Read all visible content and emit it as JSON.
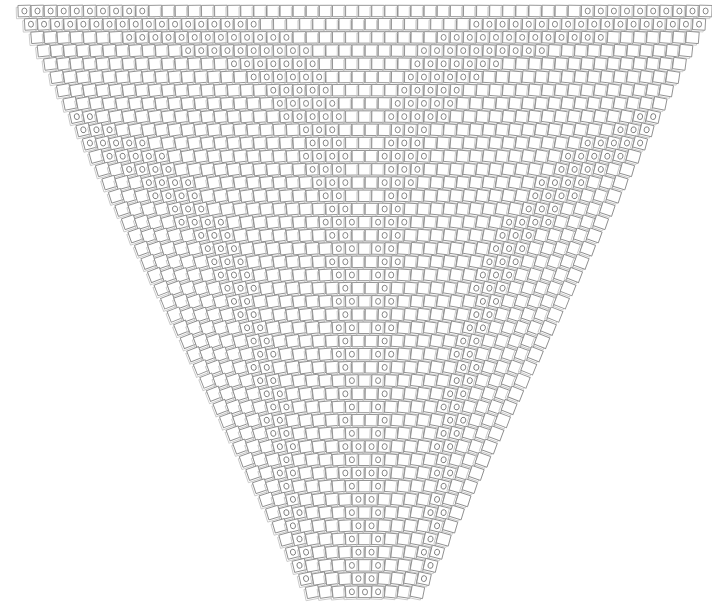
{
  "figure": {
    "title": "",
    "type": "generative-tiling-diagram",
    "width": 712,
    "height": 605,
    "background_color": "#ffffff"
  },
  "style": {
    "tile_stroke_color": "#8d8d8d",
    "tile_shadow_color": "#c9c9c9",
    "tile_fill_color": "#ffffff",
    "glyph_stroke_color": "#7a7a7a",
    "stroke_width": 0.9,
    "glyph_label": "0"
  },
  "grid": {
    "rows": 45,
    "top_row_columns": 53,
    "columns_decrement_per_row": 1,
    "cell_width": 12.6,
    "cell_height": 11.4,
    "column_spacing": 13.1,
    "row_spacing": 13.2,
    "origin_x": 21,
    "origin_y": 11,
    "apex_x": 365,
    "apex_y": 592
  },
  "transform": {
    "rotation_model": "angle = k * column_offset_from_center * row_index",
    "rotation_coefficient": 0.062,
    "max_rotation_degrees": 62,
    "shadow_offset_x": -1.8,
    "shadow_offset_y": 1.8
  },
  "glyph_rule": {
    "name": "diagonal-band-visibility",
    "description": "A zero glyph is drawn when the accumulated rotation of a tile falls inside one of the repeating diagonal bands",
    "band_period_degrees": 11.5,
    "band_width_degrees": 3.4
  },
  "chart_data": {
    "type": "scatter",
    "title": "",
    "xlabel": "",
    "ylabel": "",
    "grid": false,
    "legend": null
  }
}
